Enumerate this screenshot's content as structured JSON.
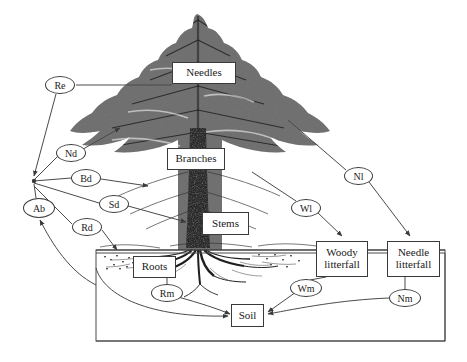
{
  "diagram": {
    "background_color": "#ffffff",
    "line_color": "#4a4a4a",
    "illustration": "pine-tree-engraving",
    "compartments": [
      {
        "id": "needles",
        "label": "Needles",
        "label_line2": "",
        "x": 172,
        "y": 62,
        "w": 64,
        "h": 22
      },
      {
        "id": "branches",
        "label": "Branches",
        "label_line2": "",
        "x": 167,
        "y": 148,
        "w": 58,
        "h": 22
      },
      {
        "id": "stems",
        "label": "Stems",
        "label_line2": "",
        "x": 202,
        "y": 212,
        "w": 47,
        "h": 23
      },
      {
        "id": "roots",
        "label": "Roots",
        "label_line2": "",
        "x": 133,
        "y": 256,
        "w": 43,
        "h": 22
      },
      {
        "id": "woody-litterfall",
        "label": "Woody",
        "label_line2": "litterfall",
        "x": 316,
        "y": 241,
        "w": 52,
        "h": 36
      },
      {
        "id": "needle-litterfall",
        "label": "Needle",
        "label_line2": "litterfall",
        "x": 387,
        "y": 241,
        "w": 53,
        "h": 36
      },
      {
        "id": "soil",
        "label": "Soil",
        "label_line2": "",
        "x": 231,
        "y": 304,
        "w": 33,
        "h": 23
      }
    ],
    "fluxes": [
      {
        "id": "re",
        "label": "Re",
        "x": 45,
        "y": 76,
        "w": 30,
        "h": 18,
        "meaning": "needle-respiration-flux"
      },
      {
        "id": "nd",
        "label": "Nd",
        "x": 56,
        "y": 144,
        "w": 30,
        "h": 18,
        "meaning": "needle-death-flux"
      },
      {
        "id": "bd",
        "label": "Bd",
        "x": 71,
        "y": 169,
        "w": 30,
        "h": 18,
        "meaning": "branch-death-flux"
      },
      {
        "id": "sd",
        "label": "Sd",
        "x": 99,
        "y": 195,
        "w": 30,
        "h": 18,
        "meaning": "stem-death-flux"
      },
      {
        "id": "rd",
        "label": "Rd",
        "x": 72,
        "y": 218,
        "w": 30,
        "h": 18,
        "meaning": "root-death-flux"
      },
      {
        "id": "ab",
        "label": "Ab",
        "x": 23,
        "y": 198,
        "w": 32,
        "h": 20,
        "meaning": "allocation-biomass-flux"
      },
      {
        "id": "nl",
        "label": "Nl",
        "x": 344,
        "y": 167,
        "w": 29,
        "h": 18,
        "meaning": "needle-litterfall-flux"
      },
      {
        "id": "wl",
        "label": "Wl",
        "x": 291,
        "y": 199,
        "w": 30,
        "h": 18,
        "meaning": "woody-litterfall-flux"
      },
      {
        "id": "wm",
        "label": "Wm",
        "x": 290,
        "y": 279,
        "w": 32,
        "h": 18,
        "meaning": "woody-mineralization-flux"
      },
      {
        "id": "nm",
        "label": "Nm",
        "x": 389,
        "y": 289,
        "w": 32,
        "h": 18,
        "meaning": "needle-mineralization-flux"
      },
      {
        "id": "rm",
        "label": "Rm",
        "x": 151,
        "y": 284,
        "w": 32,
        "h": 18,
        "meaning": "root-mineralization-flux"
      }
    ],
    "soil_block": {
      "x": 96,
      "y": 250,
      "w": 349,
      "h": 91,
      "label": "soil-profile-frame"
    }
  }
}
